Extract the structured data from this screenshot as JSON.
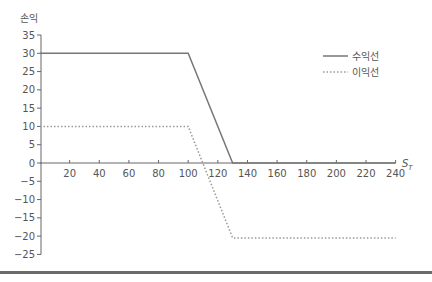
{
  "chart_data": {
    "type": "line",
    "title": "",
    "xlabel": "S_T",
    "ylabel": "손익",
    "xlim": [
      0,
      240
    ],
    "ylim": [
      -25,
      35
    ],
    "grid": false,
    "legend_position": "upper right",
    "x_ticks": [
      20,
      40,
      60,
      80,
      100,
      120,
      140,
      160,
      180,
      200,
      220,
      240
    ],
    "y_ticks": [
      35,
      30,
      25,
      20,
      15,
      10,
      5,
      0,
      -5,
      -10,
      -15,
      -20,
      -25
    ],
    "series": [
      {
        "name": "수익선",
        "style": "solid",
        "color": "#777777",
        "x": [
          0,
          100,
          130,
          240
        ],
        "y": [
          30,
          30,
          0,
          0
        ]
      },
      {
        "name": "이익선",
        "style": "dotted",
        "color": "#999999",
        "x": [
          0,
          100,
          130,
          240
        ],
        "y": [
          10,
          10,
          -20.5,
          -20.5
        ]
      }
    ]
  },
  "labels": {
    "ylabel": "손익",
    "xlabel_main": "S",
    "xlabel_sub": "T",
    "legend": [
      "수익선",
      "이익선"
    ]
  }
}
